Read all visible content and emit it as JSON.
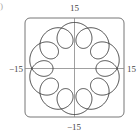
{
  "subfigure_label": ")",
  "chart_data": {
    "type": "line",
    "title": "",
    "parametric": {
      "x": "11cos(t) - 4cos(11t)",
      "y": "11sin(t) - 4sin(11t)",
      "t_range": [
        0,
        6.283185307
      ]
    },
    "xlim": [
      -15,
      15
    ],
    "ylim": [
      -15,
      15
    ],
    "tick_labels": {
      "x_min": "−15",
      "x_max": "15",
      "y_min": "−15",
      "y_max": "15"
    },
    "axes": "centered",
    "frame": "rounded-rectangle",
    "grid": false,
    "legend": null,
    "loop_count": 10,
    "colors": {
      "curve": "#333333",
      "axes": "#777777",
      "frame": "#666666"
    }
  }
}
